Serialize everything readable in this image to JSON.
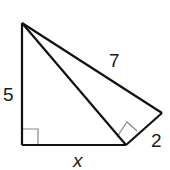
{
  "diagram": {
    "labels": {
      "left_leg": "5",
      "hypotenuse_outer": "7",
      "short_side": "2",
      "base": "x"
    },
    "colors": {
      "line": "#111111",
      "right_angle_marker": "#888888"
    }
  }
}
